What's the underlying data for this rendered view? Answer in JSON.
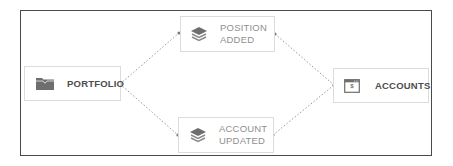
{
  "diagram": {
    "nodes": {
      "portfolio": {
        "label": "PORTFOLIO",
        "icon": "folder-icon"
      },
      "position_added": {
        "line1": "POSITION",
        "line2": "ADDED",
        "icon": "layers-icon"
      },
      "account_updated": {
        "line1": "ACCOUNT",
        "line2": "UPDATED",
        "icon": "layers-icon"
      },
      "accounts": {
        "label": "ACCOUNTS",
        "icon": "browser-dollar-icon",
        "icon_text": "$"
      }
    },
    "edges": [
      {
        "from": "portfolio",
        "to": "position_added",
        "style": "dotted"
      },
      {
        "from": "portfolio",
        "to": "account_updated",
        "style": "dotted"
      },
      {
        "from": "position_added",
        "to": "accounts",
        "style": "dotted"
      },
      {
        "from": "account_updated",
        "to": "accounts",
        "style": "dotted"
      }
    ],
    "colors": {
      "frame": "#4a4a4a",
      "node_border": "#dcdcdc",
      "connector": "#9a9a9a",
      "icon": "#6e6e6e",
      "label_dark": "#4d4d4d",
      "label_light": "#8f8f8f"
    }
  }
}
